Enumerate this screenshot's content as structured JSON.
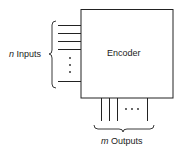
{
  "diagram": {
    "block_label": "Encoder",
    "inputs": {
      "var": "n",
      "label": "Inputs",
      "line_count_shown": 5,
      "ellipsis": "⋮"
    },
    "outputs": {
      "var": "m",
      "label": "Outputs",
      "line_count_shown": 4,
      "ellipsis": "· · ·"
    },
    "colors": {
      "stroke": "#222222",
      "background": "#ffffff"
    }
  }
}
